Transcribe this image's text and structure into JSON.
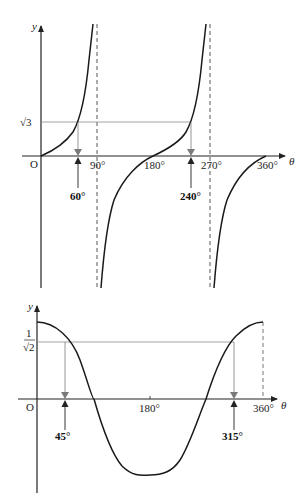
{
  "top_graph": {
    "function": "y = tan θ",
    "y_axis_label": "y",
    "x_axis_label": "θ",
    "origin_label": "O",
    "x_ticks": [
      "90°",
      "180°",
      "270°",
      "360°"
    ],
    "y_marker_label": "√3",
    "solutions": [
      "60°",
      "240°"
    ],
    "asymptotes": [
      "90°",
      "270°"
    ]
  },
  "bottom_graph": {
    "function": "y = cos θ",
    "y_axis_label": "y",
    "x_axis_label": "θ",
    "origin_label": "O",
    "x_ticks": [
      "180°",
      "360°"
    ],
    "y_marker_label_num": "1",
    "y_marker_label_den": "√2",
    "solutions": [
      "45°",
      "315°"
    ]
  },
  "colors": {
    "curve": "#1a1a1a",
    "guide": "#8a8a8a",
    "arrow_down": "#7a7a7a",
    "axis": "#222222"
  }
}
